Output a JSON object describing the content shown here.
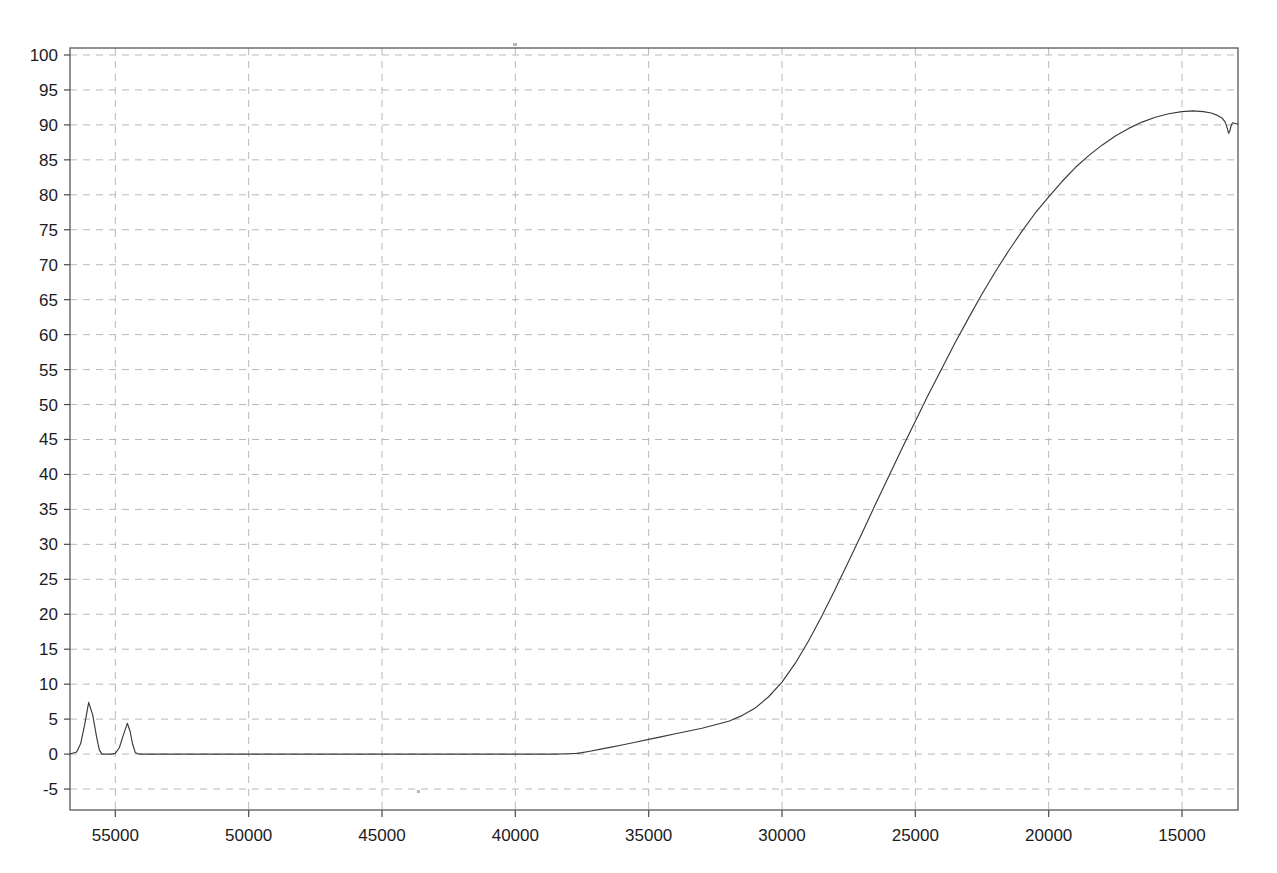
{
  "chart_data": {
    "type": "line",
    "title": "",
    "subtitle": "",
    "xlabel": "",
    "ylabel": "",
    "grid": true,
    "legend": false,
    "legend_position": "none",
    "x_axis_reversed": true,
    "xlim": [
      56700,
      12900
    ],
    "ylim": [
      -8,
      101
    ],
    "x_ticks": [
      55000,
      50000,
      45000,
      40000,
      35000,
      30000,
      25000,
      20000,
      15000
    ],
    "x_tick_labels": [
      "55000",
      "50000",
      "45000",
      "40000",
      "35000",
      "30000",
      "25000",
      "20000",
      "15000"
    ],
    "y_ticks": [
      -5,
      0,
      5,
      10,
      15,
      20,
      25,
      30,
      35,
      40,
      45,
      50,
      55,
      60,
      65,
      70,
      75,
      80,
      85,
      90,
      95,
      100
    ],
    "y_tick_labels": [
      "-5",
      "0",
      "5",
      "10",
      "15",
      "20",
      "25",
      "30",
      "35",
      "40",
      "45",
      "50",
      "55",
      "60",
      "65",
      "70",
      "75",
      "80",
      "85",
      "90",
      "95",
      "100"
    ],
    "line_color": "#3a3a3a",
    "grid_color": "#b9b9b9",
    "axis_color": "#4a4a4a",
    "series": [
      {
        "name": "trace",
        "x": [
          56700,
          56450,
          56300,
          56150,
          56000,
          55850,
          55700,
          55600,
          55500,
          55400,
          55300,
          55150,
          55000,
          54850,
          54700,
          54550,
          54450,
          54350,
          54250,
          54100,
          53950,
          53800,
          53600,
          53400,
          53000,
          52500,
          52000,
          51000,
          50000,
          49000,
          48000,
          47000,
          46000,
          45000,
          44000,
          43000,
          42000,
          41000,
          40000,
          39000,
          38500,
          38000,
          37700,
          37500,
          37200,
          36800,
          36400,
          36000,
          35500,
          35000,
          34500,
          34000,
          33500,
          33000,
          32500,
          32000,
          31500,
          31000,
          30500,
          30000,
          29500,
          29000,
          28500,
          28000,
          27500,
          27000,
          26500,
          26000,
          25500,
          25000,
          24500,
          24000,
          23500,
          23000,
          22500,
          22000,
          21500,
          21000,
          20500,
          20000,
          19500,
          19000,
          18500,
          18000,
          17500,
          17000,
          16500,
          16000,
          15500,
          15000,
          14600,
          14200,
          13900,
          13700,
          13500,
          13380,
          13300,
          13250,
          13200,
          13150,
          13100,
          13000,
          12900
        ],
        "y": [
          0.0,
          0.3,
          1.5,
          4.2,
          7.4,
          5.6,
          2.4,
          0.6,
          0.0,
          0.0,
          0.0,
          0.0,
          0.1,
          0.9,
          2.7,
          4.4,
          3.3,
          1.4,
          0.2,
          0.0,
          0.0,
          0.0,
          0.0,
          0.0,
          0.0,
          0.0,
          0.0,
          0.0,
          0.0,
          0.0,
          0.0,
          0.0,
          0.0,
          0.0,
          0.0,
          0.0,
          0.0,
          0.0,
          0.0,
          0.0,
          0.0,
          0.05,
          0.1,
          0.2,
          0.4,
          0.7,
          1.0,
          1.3,
          1.7,
          2.1,
          2.5,
          2.9,
          3.3,
          3.7,
          4.2,
          4.7,
          5.5,
          6.6,
          8.2,
          10.3,
          13.0,
          16.2,
          19.8,
          23.6,
          27.6,
          31.6,
          35.7,
          39.7,
          43.7,
          47.6,
          51.5,
          55.2,
          58.9,
          62.4,
          65.8,
          69.0,
          72.0,
          74.8,
          77.4,
          79.7,
          81.9,
          83.9,
          85.6,
          87.1,
          88.4,
          89.5,
          90.4,
          91.1,
          91.6,
          91.9,
          92.0,
          91.9,
          91.7,
          91.4,
          91.0,
          90.4,
          89.5,
          88.8,
          89.2,
          90.0,
          90.3,
          90.2,
          90.1
        ]
      }
    ],
    "annotations": [
      {
        "name": "peak-1",
        "x": 56000,
        "y": 7.4,
        "label": ""
      },
      {
        "name": "peak-2",
        "x": 54550,
        "y": 4.4,
        "label": ""
      },
      {
        "name": "plateau-max",
        "x": 13500,
        "y": 92.0,
        "label": ""
      },
      {
        "name": "end-dip",
        "x": 13150,
        "y": 88.8,
        "label": ""
      }
    ],
    "scan_specks": [
      {
        "name": "speck-top",
        "x_px": 513,
        "y_px": 43,
        "w": 4,
        "h": 3
      },
      {
        "name": "speck-mid",
        "x_px": 417,
        "y_px": 790,
        "w": 3,
        "h": 3
      }
    ]
  }
}
